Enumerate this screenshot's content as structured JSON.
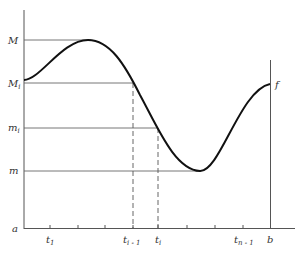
{
  "diagram": {
    "function_label": "f",
    "y_labels": {
      "M": "M",
      "Mi_base": "M",
      "Mi_sub": "i",
      "mi_base": "m",
      "mi_sub": "i",
      "m": "m"
    },
    "x_labels": {
      "a": "a",
      "t1_base": "t",
      "t1_sub": "1",
      "tim1_base": "t",
      "tim1_sub": "i - 1",
      "ti_base": "t",
      "ti_sub": "i",
      "tnm1_base": "t",
      "tnm1_sub": "n - 1",
      "b": "b"
    },
    "colors": {
      "curve": "#111111",
      "axes": "#555555",
      "guides": "#666666"
    }
  }
}
